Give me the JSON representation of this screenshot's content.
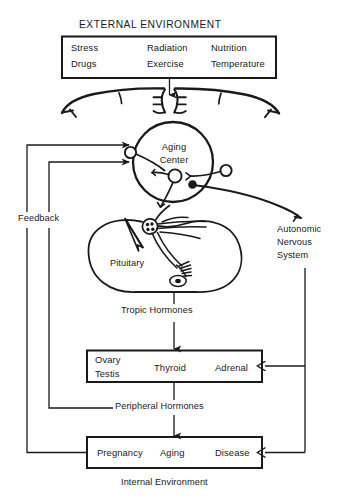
{
  "figure": {
    "title": "EXTERNAL ENVIRONMENT",
    "caption": "Internal Environment",
    "width": 339,
    "height": 499,
    "line_color": "#1a1a1a",
    "background": "#ffffff"
  },
  "external_box": {
    "name": "external-environment-box",
    "columns": [
      {
        "lines": [
          "Stress",
          "Drugs"
        ]
      },
      {
        "lines": [
          "Radiation",
          "Exercise"
        ]
      },
      {
        "lines": [
          "Nutrition",
          "Temperature"
        ]
      }
    ]
  },
  "brain": {
    "cortex_label": "cerebral-cortex-outline",
    "aging_center": {
      "line1": "Aging",
      "line2": "Center"
    },
    "pituitary": "Pituitary"
  },
  "flows": {
    "tropic_hormones": "Tropic Hormones",
    "peripheral_hormones": "Peripheral Hormones",
    "feedback": "Feedback",
    "autonomic_nervous_system": [
      "Autonomic",
      "Nervous",
      "System"
    ]
  },
  "endocrine_box": {
    "name": "endocrine-glands-box",
    "items": [
      "Ovary",
      "Testis",
      "Thyroid",
      "Adrenal"
    ]
  },
  "internal_box": {
    "name": "internal-states-box",
    "items": [
      "Pregnancy",
      "Aging",
      "Disease"
    ]
  }
}
